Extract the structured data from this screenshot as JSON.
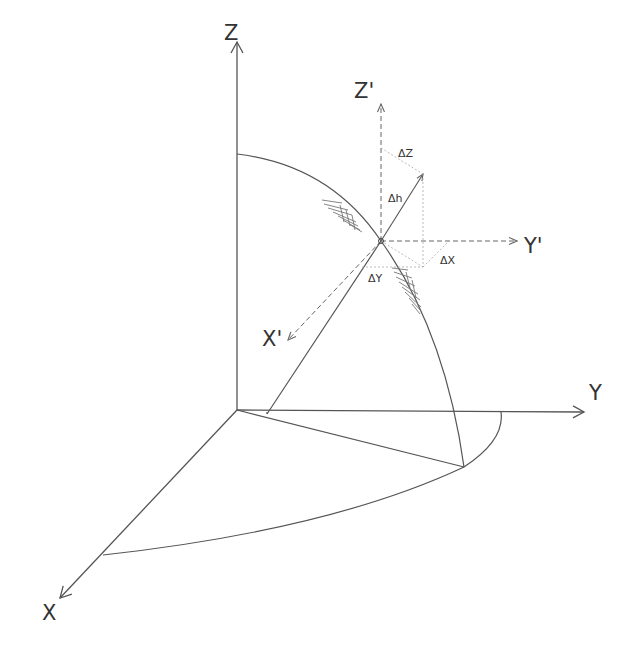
{
  "figure": {
    "axes": {
      "z": "Z",
      "y": "Y",
      "x": "X"
    },
    "local_axes": {
      "z": "Z'",
      "y": "Y'",
      "x": "X'"
    },
    "deltas": {
      "dz": "ΔZ",
      "dh": "Δh",
      "dx": "ΔX",
      "dy": "ΔY"
    },
    "colors": {
      "line": "#555555",
      "dashed": "#666666",
      "light": "#aaaaaa"
    }
  }
}
